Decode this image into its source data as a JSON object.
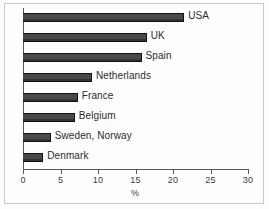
{
  "chart_data": {
    "type": "bar",
    "orientation": "horizontal",
    "title": "",
    "xlabel": "%",
    "ylabel": "",
    "xlim": [
      0,
      30
    ],
    "xticks": [
      0,
      5,
      10,
      15,
      20,
      25,
      30
    ],
    "xtick_labels": [
      "0",
      "5",
      "10",
      "15",
      "20",
      "25",
      "30"
    ],
    "grid": false,
    "legend": null,
    "bar_color": "#4a4a4a",
    "bar_edge_color": "#111111",
    "background_color": "#fdfdfd",
    "axis_color": "#58585a",
    "categories": [
      "USA",
      "UK",
      "Spain",
      "Netherlands",
      "France",
      "Belgium",
      "Sweden, Norway",
      "Denmark"
    ],
    "values": [
      21.5,
      16.5,
      15.8,
      9.2,
      7.3,
      6.9,
      3.7,
      2.7
    ]
  }
}
